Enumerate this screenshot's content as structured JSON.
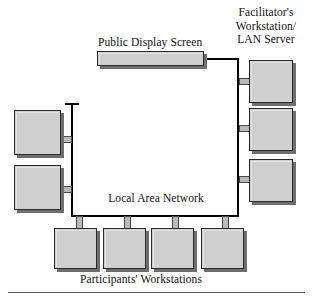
{
  "figure": {
    "title_public_display": "Public Display Screen",
    "title_facilitator": "Facilitator's\nWorkstation/\nLAN Server",
    "title_lan": "Local Area Network",
    "title_participants": "Participants' Workstations"
  },
  "colors": {
    "node_fill": "#cfcfcf",
    "node_border": "#2b2b2b",
    "node_shadow": "#6e6e6e",
    "bus_line": "#000000",
    "cable_fill": "#b9b9b9",
    "background": "#ffffff",
    "text": "#111111"
  },
  "nodes": {
    "public_display": {
      "name": "public-display-screen"
    },
    "facilitator_workstations": [
      {
        "name": "facilitator-workstation-1"
      },
      {
        "name": "facilitator-workstation-2"
      },
      {
        "name": "facilitator-workstation-3"
      }
    ],
    "left_workstations": [
      {
        "name": "left-workstation-1"
      },
      {
        "name": "left-workstation-2"
      }
    ],
    "participant_workstations": [
      {
        "name": "participant-workstation-1"
      },
      {
        "name": "participant-workstation-2"
      },
      {
        "name": "participant-workstation-3"
      },
      {
        "name": "participant-workstation-4"
      }
    ]
  }
}
